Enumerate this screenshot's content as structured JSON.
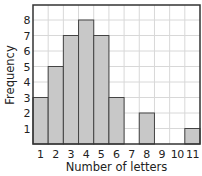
{
  "chart_data": {
    "type": "bar",
    "title": "",
    "xlabel": "Number of letters",
    "ylabel": "Frequency",
    "categories": [
      "1",
      "2",
      "3",
      "4",
      "5",
      "6",
      "7",
      "8",
      "9",
      "10",
      "11"
    ],
    "values": [
      3,
      5,
      7,
      8,
      7,
      3,
      0,
      2,
      0,
      0,
      1
    ],
    "yticks": [
      "1",
      "2",
      "3",
      "4",
      "5",
      "6",
      "7",
      "8"
    ],
    "ylim": [
      0,
      8.9
    ],
    "grid": true,
    "legend": null,
    "colors": {
      "bar_fill": "#c8c8c8",
      "bar_stroke": "#444444",
      "grid": "#d8d8d8",
      "frame": "#333333"
    }
  }
}
